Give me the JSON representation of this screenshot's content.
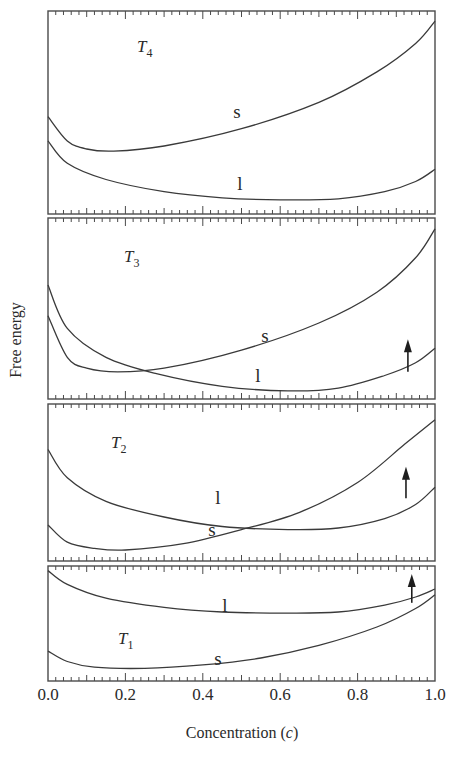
{
  "chart_data": {
    "type": "line",
    "title": "",
    "xlabel": "Concentration (c)",
    "ylabel": "Free energy",
    "xlim": [
      0.0,
      1.0
    ],
    "x_ticks": [
      "0.0",
      "0.2",
      "0.4",
      "0.6",
      "0.8",
      "1.0"
    ],
    "grid": false,
    "legend": "none (curves labeled inline)",
    "panels": [
      {
        "temperature": "T4",
        "temp_main": "T",
        "temp_sub": "4",
        "series": [
          {
            "name": "s",
            "label": "s",
            "points": [
              [
                0.0,
                0.52
              ],
              [
                0.05,
                0.64
              ],
              [
                0.1,
                0.68
              ],
              [
                0.17,
                0.69
              ],
              [
                0.3,
                0.665
              ],
              [
                0.5,
                0.58
              ],
              [
                0.7,
                0.45
              ],
              [
                0.85,
                0.3
              ],
              [
                0.95,
                0.16
              ],
              [
                1.0,
                0.05
              ]
            ]
          },
          {
            "name": "l",
            "label": "l",
            "points": [
              [
                0.0,
                0.64
              ],
              [
                0.05,
                0.75
              ],
              [
                0.15,
                0.83
              ],
              [
                0.3,
                0.89
              ],
              [
                0.45,
                0.92
              ],
              [
                0.6,
                0.93
              ],
              [
                0.75,
                0.925
              ],
              [
                0.87,
                0.89
              ],
              [
                0.95,
                0.84
              ],
              [
                1.0,
                0.78
              ]
            ]
          }
        ],
        "arrow": null
      },
      {
        "temperature": "T3",
        "temp_main": "T",
        "temp_sub": "3",
        "series": [
          {
            "name": "s",
            "label": "s",
            "points": [
              [
                0.0,
                0.54
              ],
              [
                0.05,
                0.77
              ],
              [
                0.1,
                0.83
              ],
              [
                0.18,
                0.85
              ],
              [
                0.3,
                0.83
              ],
              [
                0.5,
                0.73
              ],
              [
                0.7,
                0.58
              ],
              [
                0.85,
                0.41
              ],
              [
                0.95,
                0.22
              ],
              [
                1.0,
                0.06
              ]
            ]
          },
          {
            "name": "l",
            "label": "l",
            "points": [
              [
                0.0,
                0.37
              ],
              [
                0.05,
                0.61
              ],
              [
                0.15,
                0.77
              ],
              [
                0.28,
                0.86
              ],
              [
                0.45,
                0.93
              ],
              [
                0.62,
                0.955
              ],
              [
                0.75,
                0.94
              ],
              [
                0.87,
                0.87
              ],
              [
                0.95,
                0.8
              ],
              [
                1.0,
                0.72
              ]
            ]
          }
        ],
        "arrow": {
          "x": 0.93,
          "from": 0.85,
          "to": 0.67
        }
      },
      {
        "temperature": "T2",
        "temp_main": "T",
        "temp_sub": "2",
        "series": [
          {
            "name": "l",
            "label": "l",
            "points": [
              [
                0.0,
                0.29
              ],
              [
                0.05,
                0.47
              ],
              [
                0.15,
                0.62
              ],
              [
                0.3,
                0.72
              ],
              [
                0.45,
                0.78
              ],
              [
                0.62,
                0.8
              ],
              [
                0.75,
                0.79
              ],
              [
                0.87,
                0.73
              ],
              [
                0.95,
                0.64
              ],
              [
                1.0,
                0.53
              ]
            ]
          },
          {
            "name": "s",
            "label": "s",
            "points": [
              [
                0.0,
                0.77
              ],
              [
                0.05,
                0.88
              ],
              [
                0.12,
                0.92
              ],
              [
                0.2,
                0.93
              ],
              [
                0.35,
                0.89
              ],
              [
                0.5,
                0.8
              ],
              [
                0.65,
                0.69
              ],
              [
                0.8,
                0.5
              ],
              [
                0.92,
                0.26
              ],
              [
                1.0,
                0.1
              ]
            ]
          }
        ],
        "arrow": {
          "x": 0.925,
          "from": 0.6,
          "to": 0.4
        }
      },
      {
        "temperature": "T1",
        "temp_main": "T",
        "temp_sub": "1",
        "series": [
          {
            "name": "l",
            "label": "l",
            "points": [
              [
                0.0,
                0.04
              ],
              [
                0.05,
                0.16
              ],
              [
                0.15,
                0.28
              ],
              [
                0.3,
                0.36
              ],
              [
                0.45,
                0.4
              ],
              [
                0.62,
                0.41
              ],
              [
                0.75,
                0.4
              ],
              [
                0.87,
                0.34
              ],
              [
                0.95,
                0.27
              ],
              [
                1.0,
                0.2
              ]
            ]
          },
          {
            "name": "s",
            "label": "s",
            "points": [
              [
                0.0,
                0.74
              ],
              [
                0.05,
                0.83
              ],
              [
                0.12,
                0.88
              ],
              [
                0.25,
                0.89
              ],
              [
                0.4,
                0.86
              ],
              [
                0.55,
                0.8
              ],
              [
                0.7,
                0.69
              ],
              [
                0.85,
                0.53
              ],
              [
                0.95,
                0.37
              ],
              [
                1.0,
                0.25
              ]
            ]
          }
        ],
        "arrow": {
          "x": 0.94,
          "from": 0.32,
          "to": 0.07
        }
      }
    ]
  },
  "layout": {
    "x0": 48,
    "x1": 435,
    "panels_px": [
      {
        "top": 11,
        "bottom": 214,
        "temp_pos": [
          137,
          52
        ],
        "labels": {
          "s": [
            237,
            118
          ],
          "l": [
            240,
            190
          ]
        }
      },
      {
        "top": 218,
        "bottom": 399,
        "temp_pos": [
          124,
          262
        ],
        "labels": {
          "s": [
            265,
            342
          ],
          "l": [
            258,
            382
          ]
        }
      },
      {
        "top": 404,
        "bottom": 561,
        "temp_pos": [
          111,
          448
        ],
        "labels": {
          "l": [
            218,
            504
          ],
          "s": [
            212,
            536
          ]
        }
      },
      {
        "top": 566,
        "bottom": 681,
        "temp_pos": [
          118,
          644
        ],
        "labels": {
          "l": [
            225,
            612
          ],
          "s": [
            218,
            665
          ]
        }
      }
    ],
    "tick_label_y": 700,
    "xlabel_pos": [
      242,
      738
    ],
    "ylabel_pos": [
      17,
      340
    ]
  }
}
